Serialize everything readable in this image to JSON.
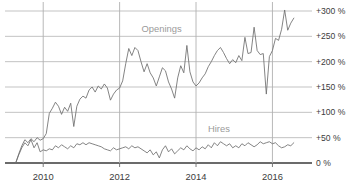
{
  "chart_data": {
    "type": "line",
    "title": "",
    "subtitle": "",
    "xlabel": "",
    "ylabel": "",
    "xlim": [
      2009.0,
      2016.8
    ],
    "ylim": [
      0,
      310
    ],
    "grid": true,
    "legend_position": "inline-annotation",
    "y_ticks": [
      0,
      50,
      100,
      150,
      200,
      250,
      300
    ],
    "y_tick_labels": [
      "0 %",
      "+50 %",
      "+100 %",
      "+150 %",
      "+200 %",
      "+250 %",
      "+300 %"
    ],
    "x_ticks": [
      2010,
      2012,
      2014,
      2016
    ],
    "x_tick_labels": [
      "2010",
      "2012",
      "2014",
      "2016"
    ],
    "annotations": [
      {
        "text": "Openings",
        "x": 2013.1,
        "y": 258
      },
      {
        "text": "Hires",
        "x": 2014.6,
        "y": 62
      }
    ],
    "series": [
      {
        "name": "Openings",
        "color": "#6e6e6e",
        "x": [
          2009.28,
          2009.36,
          2009.44,
          2009.52,
          2009.6,
          2009.68,
          2009.76,
          2009.84,
          2009.92,
          2010.0,
          2010.08,
          2010.16,
          2010.24,
          2010.32,
          2010.4,
          2010.48,
          2010.56,
          2010.64,
          2010.72,
          2010.8,
          2010.88,
          2010.96,
          2011.04,
          2011.12,
          2011.2,
          2011.28,
          2011.36,
          2011.44,
          2011.52,
          2011.6,
          2011.68,
          2011.76,
          2011.84,
          2011.92,
          2012.0,
          2012.08,
          2012.16,
          2012.24,
          2012.32,
          2012.4,
          2012.48,
          2012.56,
          2012.64,
          2012.72,
          2012.8,
          2012.88,
          2012.96,
          2013.04,
          2013.12,
          2013.2,
          2013.28,
          2013.36,
          2013.44,
          2013.52,
          2013.6,
          2013.68,
          2013.76,
          2013.84,
          2013.92,
          2014.0,
          2014.08,
          2014.16,
          2014.24,
          2014.32,
          2014.4,
          2014.48,
          2014.56,
          2014.64,
          2014.72,
          2014.8,
          2014.88,
          2014.96,
          2015.04,
          2015.12,
          2015.2,
          2015.28,
          2015.36,
          2015.44,
          2015.52,
          2015.6,
          2015.68,
          2015.76,
          2015.84,
          2015.92,
          2016.0,
          2016.08,
          2016.16,
          2016.24,
          2016.32,
          2016.4,
          2016.48,
          2016.56
        ],
        "values": [
          0,
          18,
          34,
          46,
          40,
          48,
          42,
          50,
          45,
          48,
          58,
          98,
          108,
          120,
          112,
          96,
          110,
          102,
          118,
          72,
          112,
          126,
          132,
          128,
          144,
          150,
          140,
          152,
          146,
          156,
          148,
          124,
          136,
          144,
          148,
          162,
          196,
          226,
          212,
          228,
          222,
          200,
          180,
          196,
          178,
          168,
          152,
          170,
          188,
          182,
          160,
          146,
          128,
          168,
          192,
          178,
          232,
          180,
          160,
          152,
          158,
          168,
          176,
          190,
          200,
          212,
          222,
          228,
          218,
          206,
          196,
          204,
          198,
          212,
          202,
          248,
          216,
          218,
          268,
          222,
          214,
          216,
          136,
          210,
          222,
          246,
          242,
          264,
          302,
          262,
          276,
          286
        ]
      },
      {
        "name": "Hires",
        "color": "#6e6e6e",
        "x": [
          2009.28,
          2009.36,
          2009.44,
          2009.52,
          2009.6,
          2009.68,
          2009.76,
          2009.84,
          2009.92,
          2010.0,
          2010.08,
          2010.16,
          2010.24,
          2010.32,
          2010.4,
          2010.48,
          2010.56,
          2010.64,
          2010.72,
          2010.8,
          2010.88,
          2010.96,
          2011.04,
          2011.12,
          2011.2,
          2011.28,
          2011.36,
          2011.44,
          2011.52,
          2011.6,
          2011.68,
          2011.76,
          2011.84,
          2011.92,
          2012.0,
          2012.08,
          2012.16,
          2012.24,
          2012.32,
          2012.4,
          2012.48,
          2012.56,
          2012.64,
          2012.72,
          2012.8,
          2012.88,
          2012.96,
          2013.04,
          2013.12,
          2013.2,
          2013.28,
          2013.36,
          2013.44,
          2013.52,
          2013.6,
          2013.68,
          2013.76,
          2013.84,
          2013.92,
          2014.0,
          2014.08,
          2014.16,
          2014.24,
          2014.32,
          2014.4,
          2014.48,
          2014.56,
          2014.64,
          2014.72,
          2014.8,
          2014.88,
          2014.96,
          2015.04,
          2015.12,
          2015.2,
          2015.28,
          2015.36,
          2015.44,
          2015.52,
          2015.6,
          2015.68,
          2015.76,
          2015.84,
          2015.92,
          2016.0,
          2016.08,
          2016.16,
          2016.24,
          2016.32,
          2016.4,
          2016.48,
          2016.56
        ],
        "values": [
          0,
          16,
          30,
          40,
          34,
          46,
          30,
          40,
          22,
          26,
          24,
          28,
          26,
          34,
          30,
          36,
          32,
          28,
          34,
          30,
          38,
          36,
          40,
          36,
          40,
          38,
          36,
          34,
          32,
          28,
          26,
          24,
          30,
          26,
          28,
          30,
          32,
          28,
          34,
          30,
          32,
          28,
          24,
          20,
          26,
          16,
          22,
          10,
          26,
          34,
          22,
          28,
          18,
          24,
          30,
          26,
          34,
          28,
          24,
          30,
          26,
          32,
          28,
          36,
          30,
          40,
          34,
          42,
          38,
          34,
          38,
          30,
          34,
          30,
          38,
          34,
          40,
          36,
          32,
          36,
          42,
          38,
          40,
          42,
          38,
          40,
          34,
          30,
          32,
          36,
          34,
          40
        ]
      }
    ]
  }
}
